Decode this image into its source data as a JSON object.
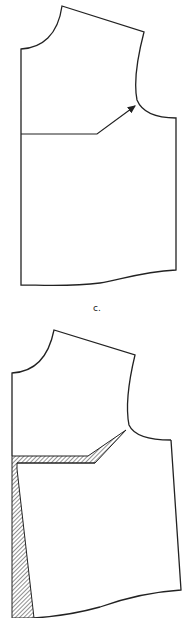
{
  "figures": [
    {
      "id": "b",
      "description": "bodice front pattern with dart line and arrow to armhole"
    },
    {
      "id": "c",
      "label": "c.",
      "description": "bodice front with hatched slashed dart opened toward armhole"
    }
  ],
  "label_c": "c.",
  "colors": {
    "stroke": "#222222",
    "background": "#ffffff",
    "hatch": "#444444"
  }
}
